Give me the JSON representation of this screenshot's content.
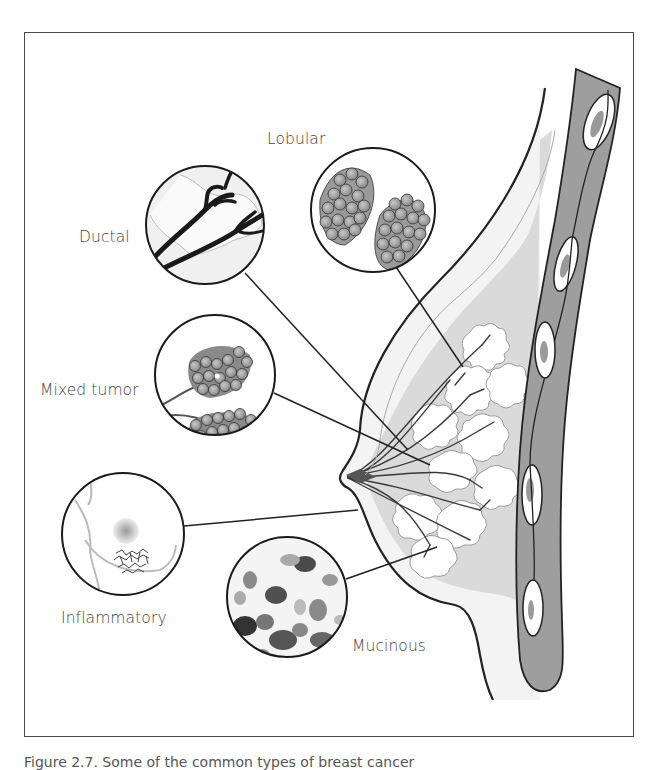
{
  "figure": {
    "labels": {
      "lobular": "Lobular",
      "ductal": "Ductal",
      "mixed_tumor": "Mixed tumor",
      "inflammatory": "Inflammatory",
      "mucinous": "Mucinous"
    },
    "caption": "Figure 2.7. Some of the common types of breast cancer",
    "colors": {
      "outline": "#222222",
      "chest_wall": "#9a9a9a",
      "tissue_light": "#e6e6e6",
      "tissue_mid": "#cfcfcf",
      "label_text": "#444444"
    }
  }
}
